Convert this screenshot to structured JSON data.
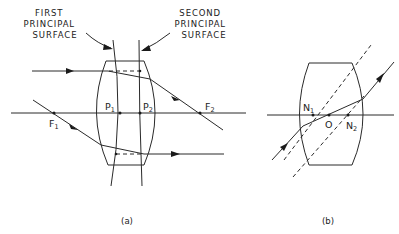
{
  "figure": {
    "colors": {
      "ink": "#2a2a2a",
      "background": "#ffffff"
    },
    "panel_a": {
      "caption": "(a)",
      "callout_first": [
        "FIRST",
        "PRINCIPAL",
        "SURFACE"
      ],
      "callout_second": [
        "SECOND",
        "PRINCIPAL",
        "SURFACE"
      ],
      "points": {
        "P1": {
          "base": "P",
          "sub": "1"
        },
        "P2": {
          "base": "P",
          "sub": "2"
        },
        "F1": {
          "base": "F",
          "sub": "1"
        },
        "F2": {
          "base": "F",
          "sub": "2"
        }
      }
    },
    "panel_b": {
      "caption": "(b)",
      "points": {
        "N1": {
          "base": "N",
          "sub": "1"
        },
        "O": {
          "base": "O",
          "sub": ""
        },
        "N2": {
          "base": "N",
          "sub": "2"
        }
      }
    }
  }
}
